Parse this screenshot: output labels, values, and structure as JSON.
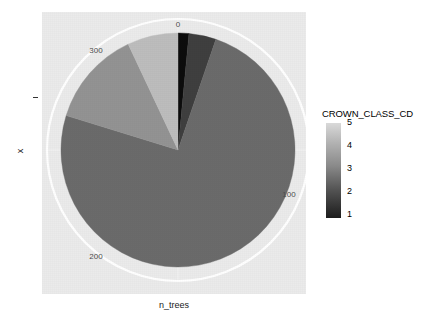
{
  "chart_data": {
    "type": "pie",
    "title": "",
    "xlabel": "n_trees",
    "ylabel": "x",
    "legend_title": "CROWN_CLASS_CD",
    "legend_position": "right",
    "legend_kind": "continuous-colorbar",
    "legend_ticks": [
      "5",
      "4",
      "3",
      "2",
      "1"
    ],
    "legend_tick_values": [
      5,
      4,
      3,
      2,
      1
    ],
    "colorbar_low_color": "#1c1c1c",
    "colorbar_high_color": "#d9d9d9",
    "panel_background": "#ebebeb",
    "grid_color": "#ffffff",
    "grid": true,
    "theta_axis": {
      "label": "n_trees",
      "ticks": [
        "0",
        "100",
        "200",
        "300"
      ],
      "tick_values": [
        0,
        100,
        200,
        300
      ],
      "range": [
        0,
        400
      ],
      "start_at_top": true,
      "direction": "clockwise"
    },
    "categories": [
      "1",
      "2",
      "3",
      "4",
      "5"
    ],
    "values": [
      6,
      15,
      298,
      53,
      28
    ],
    "total": 400,
    "slices": [
      {
        "label": "1",
        "value": 6,
        "start_deg": 0,
        "end_deg": 5.4,
        "color": "#0d0d0d"
      },
      {
        "label": "2",
        "value": 15,
        "start_deg": 5.4,
        "end_deg": 18.9,
        "color": "#3f3f3f"
      },
      {
        "label": "3",
        "value": 298,
        "start_deg": 18.9,
        "end_deg": 287.1,
        "color": "#6b6b6b"
      },
      {
        "label": "4",
        "value": 53,
        "start_deg": 287.1,
        "end_deg": 334.8,
        "color": "#939393"
      },
      {
        "label": "5",
        "value": 28,
        "start_deg": 334.8,
        "end_deg": 360,
        "color": "#bdbdbd"
      }
    ],
    "pie_center": {
      "x": 178,
      "y": 150
    },
    "pie_radius": 117,
    "grid_circle_radius": 131
  },
  "axes": {
    "x_title": "n_trees",
    "y_title": "x"
  },
  "theta_labels": {
    "t0": "0",
    "t100": "100",
    "t200": "200",
    "t300": "300"
  },
  "legend": {
    "title": "CROWN_CLASS_CD",
    "tick_5": "5",
    "tick_4": "4",
    "tick_3": "3",
    "tick_2": "2",
    "tick_1": "1"
  }
}
